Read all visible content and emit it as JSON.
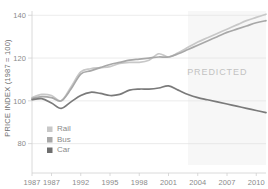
{
  "chart_data": {
    "type": "line",
    "title": "",
    "xlabel": "",
    "ylabel": "PRICE INDEX (1987 = 100)",
    "ylim": [
      70,
      142
    ],
    "xlim": [
      1987,
      2011
    ],
    "yticks": [
      "80",
      "100",
      "120",
      "140"
    ],
    "ytick_values": [
      80,
      100,
      120,
      140
    ],
    "xticks": [
      "1987",
      "1987",
      "1992",
      "1995",
      "1998",
      "2001",
      "2004",
      "2007",
      "2010"
    ],
    "xtick_values": [
      1987,
      1989,
      1992,
      1995,
      1998,
      2001,
      2004,
      2007,
      2010
    ],
    "grid": true,
    "legend_position": "bottom-left",
    "annotations": [
      {
        "text": "PREDICTED",
        "x": 2006.0,
        "y": 112.0
      }
    ],
    "predicted_region": {
      "start": 2003.0,
      "end": 2011.0
    },
    "x": [
      1987,
      1988,
      1989,
      1990,
      1991,
      1992,
      1993,
      1994,
      1995,
      1996,
      1997,
      1998,
      1999,
      2000,
      2001,
      2002,
      2003,
      2004,
      2005,
      2006,
      2007,
      2008,
      2009,
      2010,
      2011
    ],
    "series": [
      {
        "name": "Rail",
        "color": "#c8c8c8",
        "values": [
          101.5,
          103.0,
          102.5,
          100.0,
          106.5,
          113.5,
          115.0,
          115.5,
          116.0,
          117.5,
          118.0,
          118.0,
          119.0,
          122.0,
          120.5,
          122.5,
          125.0,
          127.5,
          129.5,
          131.5,
          133.5,
          135.5,
          137.5,
          139.0,
          140.5
        ]
      },
      {
        "name": "Bus",
        "color": "#a8a8a8",
        "values": [
          101.0,
          102.0,
          101.5,
          100.0,
          105.5,
          112.5,
          114.0,
          115.5,
          117.0,
          118.0,
          119.0,
          119.5,
          120.0,
          120.5,
          120.5,
          122.0,
          124.0,
          126.0,
          128.0,
          130.0,
          132.0,
          133.5,
          135.0,
          136.5,
          137.5
        ]
      },
      {
        "name": "Car",
        "color": "#7a7a7a",
        "values": [
          100.5,
          101.0,
          99.0,
          96.5,
          99.5,
          102.5,
          104.0,
          103.5,
          102.5,
          103.0,
          105.0,
          105.5,
          105.5,
          106.0,
          107.0,
          105.0,
          103.0,
          101.5,
          100.5,
          99.5,
          98.5,
          97.5,
          96.5,
          95.5,
          94.5
        ]
      }
    ]
  },
  "legend": {
    "items": [
      {
        "label": "Rail",
        "swatch": "#c8c8c8"
      },
      {
        "label": "Bus",
        "swatch": "#a8a8a8"
      },
      {
        "label": "Car",
        "swatch": "#6f6f6f"
      }
    ]
  },
  "style": {
    "grid_color": "#e3e3e3",
    "axis_color": "#d0d0d0",
    "predicted_fill": "#f7f7f7",
    "background": "#ffffff"
  }
}
